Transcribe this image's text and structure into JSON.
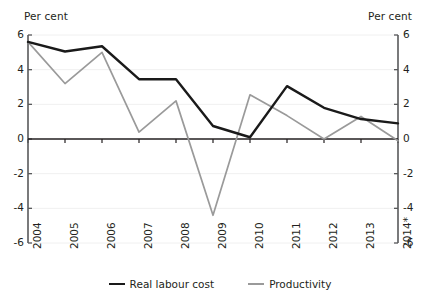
{
  "chart_data": {
    "type": "line",
    "title": "",
    "xlabel": "",
    "ylabel": "Per cent",
    "ylabel_right": "Per cent",
    "categories": [
      "2004",
      "2005",
      "2006",
      "2007",
      "2008",
      "2009",
      "2010",
      "2011",
      "2012",
      "2013",
      "2014*"
    ],
    "series": [
      {
        "name": "Real labour cost",
        "color": "#1a1a1a",
        "values": [
          5.6,
          5.05,
          5.35,
          3.45,
          3.45,
          0.75,
          0.1,
          3.05,
          1.8,
          1.15,
          0.9
        ]
      },
      {
        "name": "Productivity",
        "color": "#9a9a9a",
        "values": [
          5.6,
          3.2,
          5.0,
          0.4,
          2.2,
          -4.4,
          2.55,
          1.35,
          0.0,
          1.3,
          -0.1
        ]
      }
    ],
    "ylim": [
      -6,
      6
    ],
    "yticks": [
      6,
      4,
      2,
      0,
      -2,
      -4,
      -6
    ],
    "ytick_labels_left": [
      "6",
      "4",
      "2",
      "0",
      "-2",
      "-4",
      "-6"
    ],
    "ytick_labels_right": [
      "6",
      "4",
      "2",
      "0",
      "-2",
      "-4",
      "-6"
    ],
    "grid": true,
    "legend_position": "bottom"
  },
  "legend": {
    "items": [
      {
        "label": "Real labour cost",
        "color": "#1a1a1a"
      },
      {
        "label": "Productivity",
        "color": "#9a9a9a"
      }
    ]
  },
  "axes": {
    "left_title": "Per cent",
    "right_title": "Per cent"
  }
}
